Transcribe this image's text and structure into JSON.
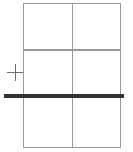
{
  "canvas": {
    "width": 133,
    "height": 152,
    "background_color": "#ffffff"
  },
  "table_grid": {
    "name": "table-grid",
    "rows": 3,
    "columns": 2,
    "line_color": "#9a9a9a",
    "line_width_px": 1.5,
    "bounds": {
      "left": 23,
      "top": 3,
      "width": 98,
      "height": 145
    },
    "column_divider_x": [
      72
    ],
    "row_divider_y": [
      48,
      97
    ],
    "cells": [
      {
        "id": "r1c1",
        "row": 1,
        "column": 1,
        "text": ""
      },
      {
        "id": "r1c2",
        "row": 1,
        "column": 2,
        "text": ""
      },
      {
        "id": "r2c1",
        "row": 2,
        "column": 1,
        "text": ""
      },
      {
        "id": "r2c2",
        "row": 2,
        "column": 2,
        "text": ""
      },
      {
        "id": "r3c1",
        "row": 3,
        "column": 1,
        "text": ""
      },
      {
        "id": "r3c2",
        "row": 3,
        "column": 2,
        "text": ""
      }
    ]
  },
  "split_rule": {
    "name": "split-rule",
    "orientation": "horizontal",
    "color": "#333333",
    "thickness_px": 3.5,
    "start_x": 4,
    "end_x": 124,
    "y": 96,
    "label": ""
  },
  "crosshair_marker": {
    "name": "crosshair-marker",
    "glyph": "plus-icon",
    "color": "#6e6e6e",
    "center_x": 15,
    "center_y": 72,
    "size_px": 17,
    "label": ""
  }
}
